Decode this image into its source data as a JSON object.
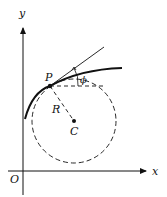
{
  "diagram": {
    "labels": {
      "y_axis": "y",
      "x_axis": "x",
      "origin": "O",
      "point": "P",
      "radius": "R",
      "center": "C",
      "angle": "ϕ"
    },
    "colors": {
      "stroke": "#111111",
      "background": "#ffffff"
    }
  }
}
